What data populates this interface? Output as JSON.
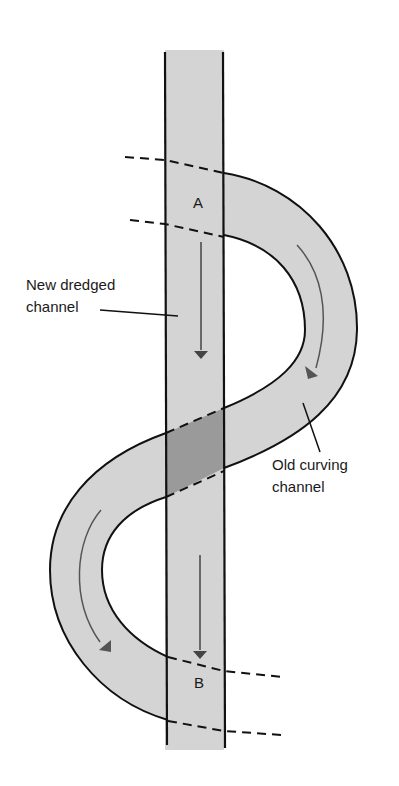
{
  "diagram": {
    "type": "river channel cut-off illustration",
    "colors": {
      "background": "#ffffff",
      "channel_fill": "#d4d4d4",
      "overlap_fill": "#9a9a9a",
      "outline": "#111111",
      "flow_arrow": "#555555"
    },
    "points": {
      "a": "A",
      "b": "B"
    },
    "labels": {
      "new_channel_line1": "New dredged",
      "new_channel_line2": "channel",
      "old_channel_line1": "Old curving",
      "old_channel_line2": "channel"
    },
    "flow_arrows": [
      {
        "location": "new channel upper",
        "direction": "down"
      },
      {
        "location": "new channel lower",
        "direction": "down"
      },
      {
        "location": "old channel right bend",
        "direction": "clockwise"
      },
      {
        "location": "old channel left bend",
        "direction": "counterclockwise"
      }
    ]
  }
}
